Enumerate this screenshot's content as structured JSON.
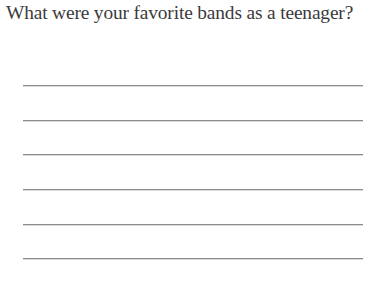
{
  "page": {
    "background_color": "#ffffff",
    "text_color": "#3b3b3d",
    "rule_color": "#8c8c8e"
  },
  "prompt": {
    "question": "What were your favorite bands as a teenager?"
  },
  "answer_area": {
    "line_count": 6,
    "lines": [
      {
        "index": 1,
        "value": "",
        "placeholder": ""
      },
      {
        "index": 2,
        "value": "",
        "placeholder": ""
      },
      {
        "index": 3,
        "value": "",
        "placeholder": ""
      },
      {
        "index": 4,
        "value": "",
        "placeholder": ""
      },
      {
        "index": 5,
        "value": "",
        "placeholder": ""
      },
      {
        "index": 6,
        "value": "",
        "placeholder": ""
      }
    ]
  }
}
